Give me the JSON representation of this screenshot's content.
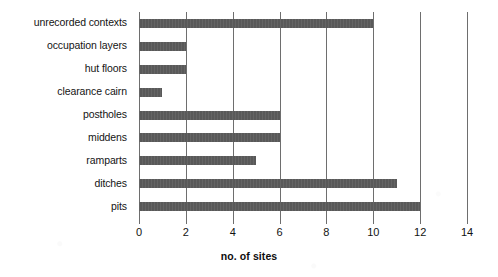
{
  "chart_data": {
    "type": "bar",
    "orientation": "horizontal",
    "title": "",
    "xlabel": "no. of sites",
    "ylabel": "",
    "xlim": [
      0,
      14
    ],
    "xticks": [
      0,
      2,
      4,
      6,
      8,
      10,
      12,
      14
    ],
    "xtick_labels": [
      "0",
      "2",
      "4",
      "6",
      "8",
      "10",
      "12",
      "14"
    ],
    "grid": true,
    "legend": false,
    "bar_color": "#595959",
    "gridline_color": "#6e6e6e",
    "categories": [
      "unrecorded contexts",
      "occupation layers",
      "hut floors",
      "clearance cairn",
      "postholes",
      "middens",
      "ramparts",
      "ditches",
      "pits"
    ],
    "values": [
      10,
      2,
      2,
      1,
      6,
      6,
      5,
      11,
      12
    ]
  }
}
